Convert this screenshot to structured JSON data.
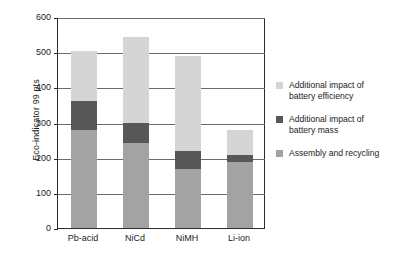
{
  "chart_data": {
    "type": "bar",
    "subtype": "stacked-bar",
    "title": "",
    "xlabel": "",
    "ylabel": "Eco-indicator 99 pts",
    "ylim": [
      0,
      600
    ],
    "yticks": [
      0,
      100,
      200,
      300,
      400,
      500,
      600
    ],
    "ytick_labels": [
      "0",
      "100",
      "200",
      "300",
      "400",
      "500",
      "600"
    ],
    "grid": true,
    "grid_axis": "y",
    "legend_position": "right",
    "categories": [
      "Pb-acid",
      "NiCd",
      "NiMH",
      "Li-ion"
    ],
    "series": [
      {
        "name": "Assembly and recycling",
        "color": "#a3a3a3",
        "values": [
          280,
          242,
          168,
          188
        ]
      },
      {
        "name": "Additional impact of battery mass",
        "color": "#575757",
        "values": [
          82,
          57,
          52,
          20
        ]
      },
      {
        "name": "Additional impact of battery efficiency",
        "color": "#d5d5d5",
        "values": [
          141,
          244,
          270,
          70
        ]
      }
    ],
    "totals": [
      503,
      543,
      490,
      278
    ]
  },
  "axis": {
    "y_title": "Eco-indicator 99 pts",
    "y_ticks": [
      "600",
      "500",
      "400",
      "300",
      "200",
      "100",
      "0"
    ]
  },
  "x_axis": {
    "labels": [
      "Pb-acid",
      "NiCd",
      "NiMH",
      "Li-ion"
    ]
  },
  "legend": {
    "items": [
      {
        "label": "Additional impact of battery efficiency",
        "line1": "Additional impact of",
        "line2": "battery efficiency",
        "color": "#d5d5d5"
      },
      {
        "label": "Additional impact of battery mass",
        "line1": "Additional impact of",
        "line2": "battery mass",
        "color": "#575757"
      },
      {
        "label": "Assembly and recycling",
        "line1": "Assembly and recycling",
        "line2": "",
        "color": "#a3a3a3"
      }
    ]
  },
  "colors": {
    "efficiency": "#d5d5d5",
    "mass": "#575757",
    "assembly": "#a3a3a3",
    "axis": "#2b2b2b",
    "grid": "#6d6d6d",
    "background": "#ffffff"
  }
}
